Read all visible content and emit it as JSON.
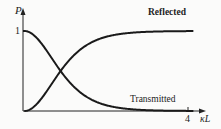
{
  "chart_data": {
    "type": "line",
    "title": "",
    "xlabel": "κL",
    "ylabel": "P",
    "xlim": [
      0,
      4.2
    ],
    "ylim": [
      0,
      1.25
    ],
    "x_ticks": [
      {
        "value": 4,
        "label": "4"
      }
    ],
    "y_ticks": [
      {
        "value": 1,
        "label": "1"
      }
    ],
    "grid": false,
    "legend": "inline labels",
    "series": [
      {
        "name": "Reflected",
        "formula": "tanh^2(κL)",
        "x": [
          0,
          0.25,
          0.5,
          0.75,
          0.88,
          1,
          1.25,
          1.5,
          2,
          2.5,
          3,
          3.5,
          4
        ],
        "values": [
          0,
          0.06,
          0.21,
          0.4,
          0.5,
          0.58,
          0.72,
          0.82,
          0.93,
          0.97,
          0.99,
          1.0,
          1.0
        ]
      },
      {
        "name": "Transmitted",
        "formula": "sech^2(κL)",
        "x": [
          0,
          0.25,
          0.5,
          0.75,
          0.88,
          1,
          1.25,
          1.5,
          2,
          2.5,
          3,
          3.5,
          4
        ],
        "values": [
          1,
          0.94,
          0.79,
          0.6,
          0.5,
          0.42,
          0.28,
          0.18,
          0.07,
          0.03,
          0.01,
          0.0,
          0.0
        ]
      }
    ],
    "annotations": [
      {
        "text": "Reflected",
        "near": "upper curve, right end"
      },
      {
        "text": "Transmitted",
        "near": "lower curve, right end"
      }
    ]
  },
  "labels": {
    "y_axis": "P",
    "x_axis": "κL",
    "y_tick_1": "1",
    "x_tick_4": "4",
    "reflected": "Reflected",
    "transmitted": "Transmitted"
  }
}
